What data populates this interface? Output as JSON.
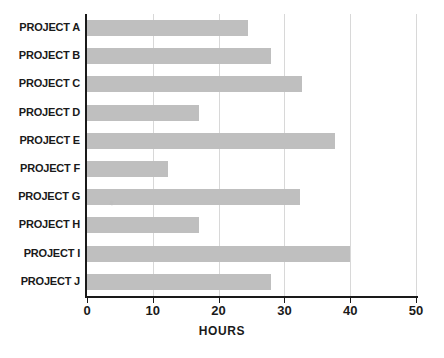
{
  "chart_data": {
    "type": "bar",
    "orientation": "horizontal",
    "title": "",
    "xlabel": "HOURS",
    "ylabel": "",
    "categories": [
      "PROJECT A",
      "PROJECT B",
      "PROJECT C",
      "PROJECT D",
      "PROJECT E",
      "PROJECT F",
      "PROJECT G",
      "PROJECT H",
      "PROJECT I",
      "PROJECT J"
    ],
    "values": [
      24.5,
      28,
      32.7,
      17,
      37.7,
      12.3,
      32.4,
      17,
      40,
      28
    ],
    "xlim": [
      0,
      50
    ],
    "xticks": [
      0,
      10,
      20,
      30,
      40,
      50
    ],
    "xticklabels": [
      "0",
      "10",
      "20",
      "30",
      "40",
      "50"
    ],
    "grid": "vertical",
    "legend": "none",
    "bar_color": "#bfbfbf",
    "axis_color": "#1a1a1a",
    "grid_color": "#d8d8d8",
    "background_color": "#ffffff"
  }
}
